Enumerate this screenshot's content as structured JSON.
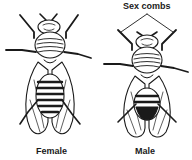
{
  "diagram": {
    "annotation": "Sex combs",
    "figures": [
      {
        "label": "Female"
      },
      {
        "label": "Male"
      }
    ],
    "colors": {
      "ink": "#1a1a1a",
      "background": "#ffffff"
    }
  }
}
